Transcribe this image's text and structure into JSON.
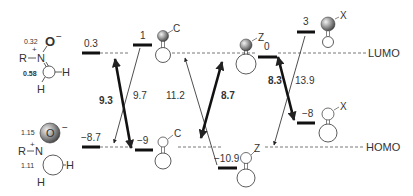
{
  "reagent": {
    "lumo_coeffs": {
      "O": "0.32",
      "C": "0.58"
    },
    "homo_coeffs": {
      "O": "1.15",
      "C": "1.11"
    },
    "atoms": {
      "R": "R",
      "N": "N",
      "O": "O",
      "H1": "H",
      "H2": "H",
      "plus": "+",
      "minus": "−"
    }
  },
  "levels": {
    "nitrone_lumo": "0.3",
    "nitrone_homo": "−8.7",
    "c_lumo": "1",
    "c_homo": "−9",
    "z_lumo": "0",
    "z_homo": "−10.9",
    "x_lumo": "3",
    "x_homo": "−8"
  },
  "substituents": {
    "c": "C",
    "z": "Z",
    "x": "X"
  },
  "gaps": {
    "c_major": "9.3",
    "c_minor": "9.7",
    "z_minor": "11.2",
    "z_major": "8.7",
    "x_major": "8.3",
    "x_minor": "13.9"
  },
  "reference_lines": {
    "lumo": "LUMO",
    "homo": "HOMO"
  },
  "colors": {
    "line": "#222222",
    "dash": "#555555",
    "sphere_light": "#dddddd",
    "sphere_dark": "#555555"
  }
}
